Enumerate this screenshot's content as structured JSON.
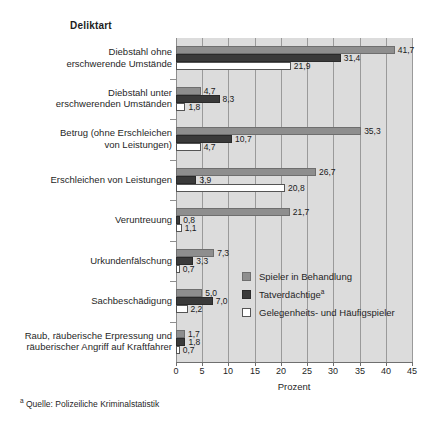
{
  "chart_data": {
    "type": "bar",
    "orientation": "horizontal",
    "title": "Deliktart",
    "xlabel": "Prozent",
    "ylabel": "",
    "xlim": [
      0,
      45
    ],
    "xticks": [
      0,
      5,
      10,
      15,
      20,
      25,
      30,
      35,
      40,
      45
    ],
    "grid": true,
    "legend_position": "inside-right-middle",
    "categories": [
      "Diebstahl ohne erschwerende Umstände",
      "Diebstahl unter erschwerenden Umständen",
      "Betrug (ohne Erschleichen von Leistungen)",
      "Erschleichen von Leistungen",
      "Veruntreuung",
      "Urkundenfälschung",
      "Sachbeschädigung",
      "Raub, räuberische Erpressung und räuberischer Angriff auf Kraftfahrer"
    ],
    "category_lines": [
      [
        "Diebstahl ohne",
        "erschwerende Umstände"
      ],
      [
        "Diebstahl unter",
        "erschwerenden Umständen"
      ],
      [
        "Betrug (ohne Erschleichen",
        "von Leistungen)"
      ],
      [
        "Erschleichen von Leistungen"
      ],
      [
        "Veruntreuung"
      ],
      [
        "Urkundenfälschung"
      ],
      [
        "Sachbeschädigung"
      ],
      [
        "Raub, räuberische Erpressung und",
        "räuberischer Angriff auf Kraftfahrer"
      ]
    ],
    "series": [
      {
        "name": "Spieler in Behandlung",
        "color": "#8e8e8e",
        "values": [
          41.7,
          4.7,
          35.3,
          26.7,
          21.7,
          7.3,
          5.0,
          1.7
        ],
        "labels": [
          "41,7",
          "4,7",
          "35,3",
          "26,7",
          "21,7",
          "7,3",
          "5,0",
          "1,7"
        ]
      },
      {
        "name": "Tatverdächtige",
        "name_sup": "a",
        "color": "#3a3a3a",
        "values": [
          31.4,
          8.3,
          10.7,
          3.9,
          0.8,
          3.3,
          7.0,
          1.8
        ],
        "labels": [
          "31,4",
          "8,3",
          "10,7",
          "3,9",
          "0,8",
          "3,3",
          "7,0",
          "1,8"
        ]
      },
      {
        "name": "Gelegenheits- und Häufigspieler",
        "color": "#ffffff",
        "values": [
          21.9,
          1.8,
          4.7,
          20.8,
          1.1,
          0.7,
          2.2,
          0.7
        ],
        "labels": [
          "21,9",
          "1,8",
          "4,7",
          "20,8",
          "1,1",
          "0,7",
          "2,2",
          "0,7"
        ]
      }
    ]
  },
  "footnote": {
    "marker": "a",
    "text": "Quelle: Polizeiliche Kriminalstatistik"
  }
}
